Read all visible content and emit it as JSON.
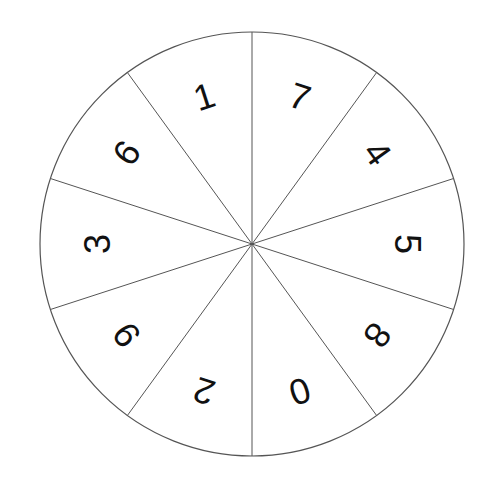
{
  "wheel": {
    "center": [
      252,
      244
    ],
    "radius": 212,
    "label_radius": 155,
    "stroke_color": "#555555",
    "text_color": "#111111",
    "sectors": [
      {
        "label": "7"
      },
      {
        "label": "4"
      },
      {
        "label": "5"
      },
      {
        "label": "8"
      },
      {
        "label": "0"
      },
      {
        "label": "2"
      },
      {
        "label": "9"
      },
      {
        "label": "3"
      },
      {
        "label": "6"
      },
      {
        "label": "1"
      }
    ]
  }
}
